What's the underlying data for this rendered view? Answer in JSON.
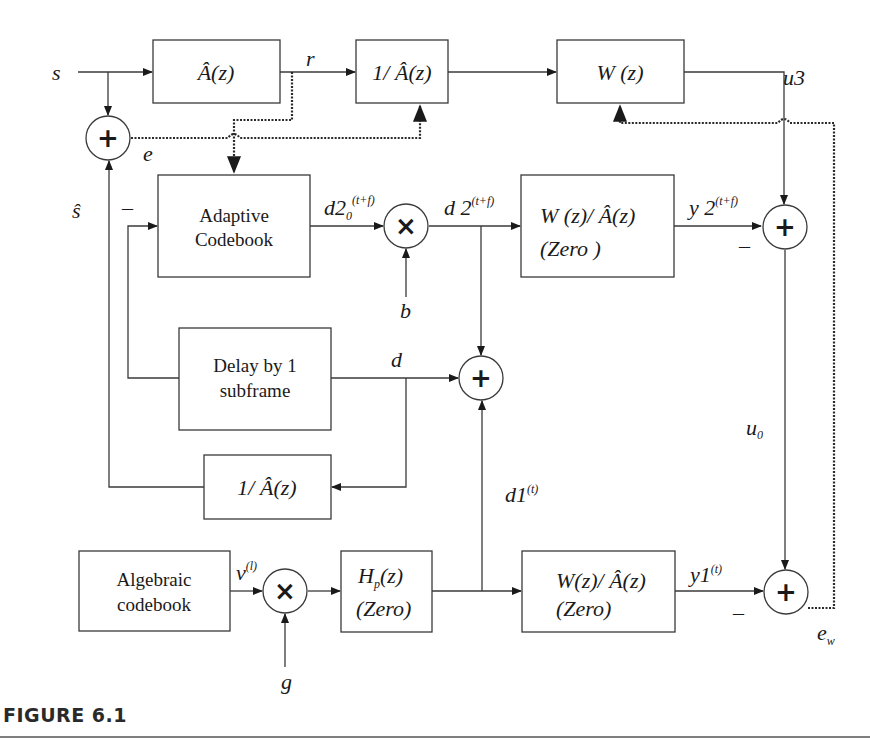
{
  "figure": {
    "caption": "FIGURE 6.1",
    "type": "block-diagram"
  },
  "signals": {
    "s": "s",
    "r": "r",
    "e": "e",
    "s_hat": "ŝ",
    "u3": "u3",
    "d20_main": "d2",
    "d20_sub": "0",
    "d20_sup": "(t+f)",
    "d2_main": "d 2",
    "d2_sup": "(t+f)",
    "y2_main": "y 2",
    "y2_sup": "(t+f)",
    "b": "b",
    "d": "d",
    "u0_main": "u",
    "u0_sub": "0",
    "d1_main": "d1",
    "d1_sup": "(t)",
    "v_main": "v",
    "v_sup": "(l)",
    "g": "g",
    "y1_main": "y1",
    "y1_sup": "(t)",
    "ew_main": "e",
    "ew_sub": "w"
  },
  "signs": {
    "minus_adaptive": "–",
    "minus_y2": "–",
    "minus_y1": "–"
  },
  "operators": {
    "sum": "+",
    "multiply": "×"
  },
  "blocks": {
    "a_hat": "Â(z)",
    "inv_a_hat_top": "1/ Â(z)",
    "w": "W (z)",
    "adaptive_line1": "Adaptive",
    "adaptive_line2": "Codebook",
    "w_over_a_top_line1": "W (z)/ Â(z)",
    "w_over_a_top_line2": "(Zero )",
    "delay_line1": "Delay by 1",
    "delay_line2": "subframe",
    "inv_a_hat_bottom": "1/ Â(z)",
    "algebraic_line1": "Algebraic",
    "algebraic_line2": "codebook",
    "hp_line1_main": "H",
    "hp_line1_sub": "p",
    "hp_line1_rest": "(z)",
    "hp_line2": "(Zero)",
    "w_over_a_bottom_line1": "W(z)/ Â(z)",
    "w_over_a_bottom_line2": "(Zero)"
  }
}
